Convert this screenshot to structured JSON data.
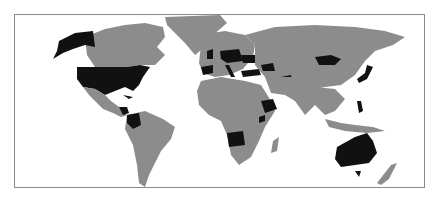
{
  "map": {
    "type": "world choropleth",
    "colors": {
      "background": "#ffffff",
      "land_default": "#8c8c8c",
      "highlighted": "#111111",
      "frame_border": "#8a8a8a"
    },
    "highlighted_countries": [
      "United States",
      "Colombia",
      "Nicaragua",
      "Honduras",
      "Cuba",
      "United Kingdom",
      "Spain",
      "Germany",
      "Poland",
      "Italy",
      "Ukraine",
      "Romania",
      "Turkey",
      "Georgia",
      "Azerbaijan",
      "Afghanistan",
      "Mongolia",
      "Japan",
      "Philippines",
      "Ethiopia",
      "Kenya",
      "Angola",
      "Australia"
    ]
  }
}
